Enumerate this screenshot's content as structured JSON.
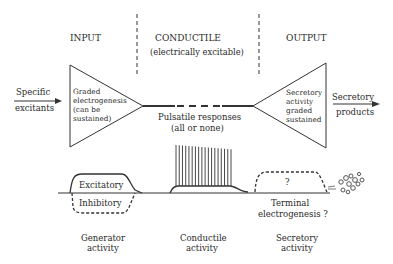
{
  "sections": {
    "input": "INPUT",
    "conductile": "CONDUCTILE",
    "conductile_sub": "(electrically excitable)",
    "output": "OUTPUT"
  },
  "input_side": {
    "excitants_line1": "Specific",
    "excitants_line2": "excitants",
    "triangle_lines": [
      "Graded",
      "electrogenesis",
      "(can be",
      "sustained)"
    ]
  },
  "middle": {
    "pulsatile_line1": "Pulsatile responses",
    "pulsatile_line2": "(all or none)"
  },
  "output_side": {
    "triangle_lines": [
      "Secretory",
      "activity",
      "graded",
      "sustained"
    ],
    "products_line1": "Secretory",
    "products_line2": "products"
  },
  "waveforms": {
    "excitatory": "Excitatory",
    "inhibitory": "Inhibitory",
    "question": "?",
    "terminal_line1": "Terminal",
    "terminal_line2": "electrogenesis ?",
    "spike_count": 18
  },
  "captions": {
    "generator_1": "Generator",
    "generator_2": "activity",
    "conductile_1": "Conductile",
    "conductile_2": "activity",
    "secretory_1": "Secretory",
    "secretory_2": "activity"
  }
}
